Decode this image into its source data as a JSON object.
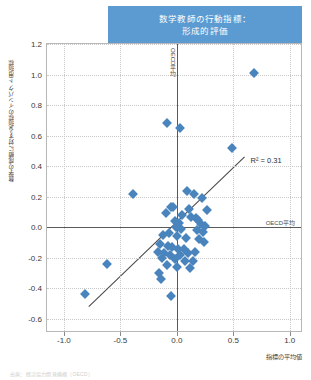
{
  "title": {
    "line1": "数学教師の行動指標：",
    "line2": "形成的評価",
    "banner_color": "#5b9bd1"
  },
  "axes": {
    "y_title": "数学の成績に対する指標のインパクト用指標",
    "x_title": "指標の平均値",
    "y_ticks": [
      "1.2",
      "1.0",
      "0.8",
      "0.6",
      "0.4",
      "0.2",
      "0.0",
      "-0.2",
      "-0.4",
      "-0.6"
    ],
    "x_ticks": [
      "-1.0",
      "-0.5",
      "0.0",
      "0.5",
      "1.0"
    ]
  },
  "annotations": {
    "oecd_average_vertical": "OECD平均",
    "oecd_average_horizontal": "OECD平均",
    "r_squared": "R² = 0.31"
  },
  "footnote": "出典：経済協力開発機構（OECD）",
  "marker_color": "#4a84bd",
  "trendline_color": "#4a4a4a",
  "chart_data": {
    "type": "scatter",
    "xlabel": "指標の平均値",
    "ylabel": "数学の成績に対する指標のインパクト用指標",
    "xlim": [
      -1.15,
      1.1
    ],
    "ylim": [
      -0.68,
      1.2
    ],
    "xticks": [
      -1.0,
      -0.5,
      0.0,
      0.5,
      1.0
    ],
    "yticks": [
      -0.6,
      -0.4,
      -0.2,
      0.0,
      0.2,
      0.4,
      0.6,
      0.8,
      1.0,
      1.2
    ],
    "grid": true,
    "legend": false,
    "r_squared": 0.31,
    "reference_lines": {
      "vertical_x": 0.0,
      "horizontal_y": 0.0,
      "label": "OECD平均"
    },
    "trendline": {
      "x_start": -0.78,
      "y_start": -0.52,
      "x_end": 0.6,
      "y_end": 0.46
    },
    "points": [
      {
        "x": 0.68,
        "y": 1.01
      },
      {
        "x": -0.09,
        "y": 0.68
      },
      {
        "x": 0.03,
        "y": 0.65
      },
      {
        "x": 0.49,
        "y": 0.52
      },
      {
        "x": -0.39,
        "y": 0.22
      },
      {
        "x": 0.09,
        "y": 0.24
      },
      {
        "x": 0.15,
        "y": 0.22
      },
      {
        "x": 0.22,
        "y": 0.19
      },
      {
        "x": -0.05,
        "y": 0.13
      },
      {
        "x": -0.03,
        "y": 0.13
      },
      {
        "x": 0.11,
        "y": 0.12
      },
      {
        "x": 0.27,
        "y": 0.11
      },
      {
        "x": -0.1,
        "y": 0.09
      },
      {
        "x": 0.05,
        "y": 0.08
      },
      {
        "x": 0.13,
        "y": 0.07
      },
      {
        "x": 0.17,
        "y": 0.06
      },
      {
        "x": 0.19,
        "y": 0.05
      },
      {
        "x": -0.02,
        "y": 0.04
      },
      {
        "x": 0.02,
        "y": 0.03
      },
      {
        "x": 0.21,
        "y": 0.02
      },
      {
        "x": 0.25,
        "y": 0.01
      },
      {
        "x": -0.01,
        "y": 0.0
      },
      {
        "x": 0.04,
        "y": -0.01
      },
      {
        "x": 0.18,
        "y": -0.02
      },
      {
        "x": 0.23,
        "y": -0.03
      },
      {
        "x": -0.07,
        "y": -0.04
      },
      {
        "x": -0.12,
        "y": -0.05
      },
      {
        "x": 0.0,
        "y": -0.06
      },
      {
        "x": 0.08,
        "y": -0.07
      },
      {
        "x": 0.2,
        "y": -0.08
      },
      {
        "x": 0.24,
        "y": -0.1
      },
      {
        "x": -0.15,
        "y": -0.11
      },
      {
        "x": -0.08,
        "y": -0.12
      },
      {
        "x": -0.04,
        "y": -0.13
      },
      {
        "x": 0.01,
        "y": -0.14
      },
      {
        "x": 0.06,
        "y": -0.14
      },
      {
        "x": -0.17,
        "y": -0.16
      },
      {
        "x": -0.11,
        "y": -0.17
      },
      {
        "x": -0.06,
        "y": -0.18
      },
      {
        "x": 0.03,
        "y": -0.18
      },
      {
        "x": 0.1,
        "y": -0.17
      },
      {
        "x": 0.16,
        "y": -0.16
      },
      {
        "x": -0.13,
        "y": -0.2
      },
      {
        "x": -0.02,
        "y": -0.21
      },
      {
        "x": 0.07,
        "y": -0.22
      },
      {
        "x": 0.14,
        "y": -0.22
      },
      {
        "x": -0.09,
        "y": -0.25
      },
      {
        "x": 0.0,
        "y": -0.26
      },
      {
        "x": -0.62,
        "y": -0.24
      },
      {
        "x": -0.14,
        "y": -0.34
      },
      {
        "x": -0.05,
        "y": -0.45
      },
      {
        "x": -0.81,
        "y": -0.44
      },
      {
        "x": -0.16,
        "y": -0.3
      },
      {
        "x": 0.12,
        "y": -0.27
      }
    ]
  }
}
